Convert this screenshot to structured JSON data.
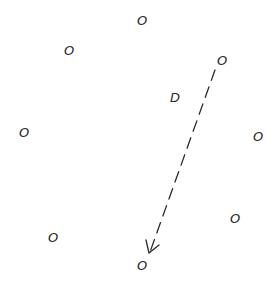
{
  "diagram": {
    "nodes": [
      {
        "id": "o-top",
        "label": "O"
      },
      {
        "id": "o-upper-left",
        "label": "O"
      },
      {
        "id": "o-upper-right",
        "label": "O"
      },
      {
        "id": "center-d",
        "label": "D"
      },
      {
        "id": "o-left",
        "label": "O"
      },
      {
        "id": "o-right",
        "label": "O"
      },
      {
        "id": "o-lower-right",
        "label": "O"
      },
      {
        "id": "o-lower-left",
        "label": "O"
      },
      {
        "id": "o-bottom",
        "label": "O"
      }
    ],
    "edges": [
      {
        "from": "o-upper-right",
        "to": "o-bottom",
        "style": "dashed",
        "arrow": "end"
      }
    ],
    "colors": {
      "ink": "#2a2a2a",
      "background": "#ffffff"
    }
  }
}
